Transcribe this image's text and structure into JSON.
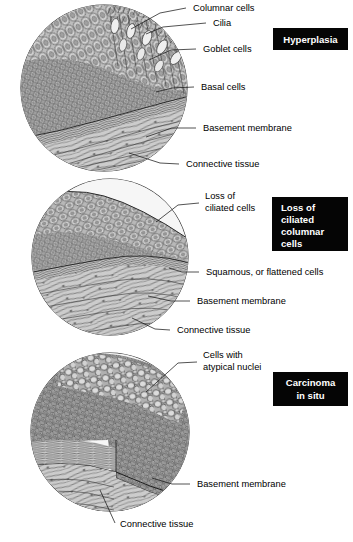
{
  "figure": {
    "background_color": "#ffffff",
    "ink_color": "#1a1a1a",
    "badge_bg_color": "#050505",
    "badge_text_color": "#ffffff",
    "tissue_fill_color": "#c9c9c9",
    "epithelium_fill_color": "#b5b5b5",
    "lumen_fill_color": "#f2f2f2",
    "width": 353,
    "height": 542
  },
  "panels": [
    {
      "id": "panel-hyperplasia",
      "badge": "Hyperplasia",
      "badge_lines": [
        "Hyperplasia"
      ],
      "badge_box": {
        "x": 273,
        "y": 28,
        "w": 75,
        "h": 22
      },
      "circle": {
        "cx": 104,
        "cy": 88,
        "r": 84
      },
      "labels": [
        {
          "name": "columnar-cells",
          "text": "Columnar cells",
          "x": 193,
          "y": 11,
          "leader": "M 186 8 L 160 13 L 131 29"
        },
        {
          "name": "cilia",
          "text": "Cilia",
          "x": 213,
          "y": 26,
          "leader": "M 206 23 L 163 27 L 146 34"
        },
        {
          "name": "goblet-cells",
          "text": "Goblet cells",
          "x": 203,
          "y": 52,
          "leader": "M 196 49 L 171 50 L 149 60"
        },
        {
          "name": "basal-cells",
          "text": "Basal cells",
          "x": 201,
          "y": 90,
          "leader": "M 194 87 L 172 88 L 156 92"
        },
        {
          "name": "basement-membrane",
          "text": "Basement membrane",
          "x": 203,
          "y": 131,
          "leader": "M 196 128 L 172 128 L 146 137"
        },
        {
          "name": "connective-tissue",
          "text": "Connective tissue",
          "x": 186,
          "y": 167,
          "leader": "M 179 164 L 160 163 L 129 153"
        }
      ]
    },
    {
      "id": "panel-loss-of-ciliated-columnar-cells",
      "badge": "Loss of ciliated columnar cells",
      "badge_lines": [
        "Loss of",
        "ciliated",
        "columnar",
        "cells"
      ],
      "badge_box": {
        "x": 272,
        "y": 197,
        "w": 76,
        "h": 54
      },
      "circle": {
        "cx": 110,
        "cy": 257,
        "r": 79
      },
      "labels": [
        {
          "name": "loss-of-ciliated-cells",
          "text": "Loss of",
          "x": 205,
          "y": 199,
          "text2": "ciliated cells",
          "y2": 211,
          "leader": "M 199 203 L 178 205 L 156 222"
        },
        {
          "name": "squamous-or-flattened-cells",
          "text": "Squamous, or flattened cells",
          "x": 206,
          "y": 275,
          "leader": "M 199 272 L 182 272 L 169 268"
        },
        {
          "name": "basement-membrane",
          "text": "Basement membrane",
          "x": 197,
          "y": 304,
          "leader": "M 190 301 L 171 301 L 148 296"
        },
        {
          "name": "connective-tissue",
          "text": "Connective tissue",
          "x": 177,
          "y": 333,
          "leader": "M 170 330 L 155 329 L 132 318"
        }
      ]
    },
    {
      "id": "panel-carcinoma-in-situ",
      "badge": "Carcinoma in situ",
      "badge_lines": [
        "Carcinoma",
        "in situ"
      ],
      "badge_box": {
        "x": 273,
        "y": 372,
        "w": 75,
        "h": 34
      },
      "circle": {
        "cx": 110,
        "cy": 432,
        "r": 80
      },
      "labels": [
        {
          "name": "cells-with-atypical-nuclei",
          "text": "Cells with",
          "x": 203,
          "y": 358,
          "text2": "atypical nuclei",
          "y2": 370,
          "leader": "M 197 362 L 178 363 L 146 392"
        },
        {
          "name": "basement-membrane",
          "text": "Basement membrane",
          "x": 197,
          "y": 487,
          "leader": "M 190 484 L 172 484 L 152 478"
        },
        {
          "name": "connective-tissue",
          "text": "Connective tissue",
          "x": 120,
          "y": 527,
          "leader": "M 115 523 L 110 512 L 100 490"
        }
      ]
    }
  ]
}
